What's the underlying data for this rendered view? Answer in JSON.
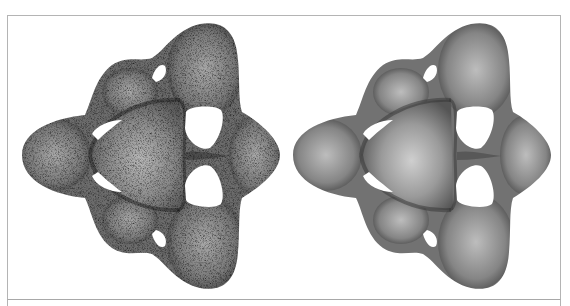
{
  "figure": {
    "panel_count": 2,
    "panels": [
      {
        "id": "left",
        "rendering": "stippled",
        "shape": "three-fold symmetric surface with holes",
        "base_color": "#6a6a6a",
        "highlight_color": "#bdbdbd"
      },
      {
        "id": "right",
        "rendering": "smooth-shaded",
        "shape": "three-fold symmetric surface with holes",
        "base_color": "#6e6e6e",
        "highlight_color": "#c8c8c8"
      }
    ],
    "frame_color": "#b4b4b4",
    "background": "#ffffff"
  }
}
